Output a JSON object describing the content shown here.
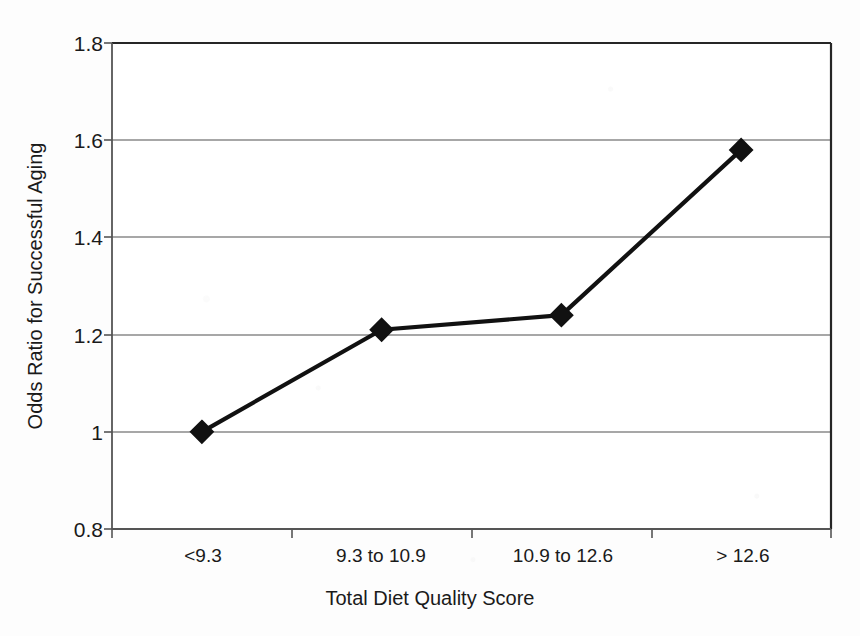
{
  "chart_data": {
    "type": "line",
    "title": "",
    "subtitle": "",
    "xlabel": "Total Diet Quality Score",
    "ylabel": "Odds Ratio for Successful Aging",
    "categories": [
      "<9.3",
      "9.3 to 10.9",
      "10.9 to 12.6",
      "> 12.6"
    ],
    "values": [
      1.0,
      1.21,
      1.24,
      1.58
    ],
    "series": [
      {
        "name": "Odds Ratio for Successful Aging",
        "values": [
          1.0,
          1.21,
          1.24,
          1.58
        ]
      }
    ],
    "ylim": [
      0.8,
      1.8
    ],
    "yticks": [
      0.8,
      1,
      1.2,
      1.4,
      1.6,
      1.8
    ],
    "ytick_labels": [
      "0.8",
      "1",
      "1.2",
      "1.4",
      "1.6",
      "1.8"
    ],
    "grid": true,
    "grid_axis": "y",
    "legend": false,
    "legend_position": "none",
    "marker": "diamond",
    "marker_color": "#111111",
    "line_color": "#111111",
    "plot_background": "#ffffff",
    "grid_color": "#8a8a8a",
    "axis_color": "#333333"
  },
  "axes": {
    "y_tick_labels": [
      "1.8",
      "1.6",
      "1.4",
      "1.2",
      "1",
      "0.8"
    ],
    "x_category_labels": [
      "<9.3",
      "9.3 to 10.9",
      "10.9 to 12.6",
      "> 12.6"
    ],
    "y_title": "Odds Ratio for Successful Aging",
    "x_title": "Total Diet Quality Score"
  }
}
